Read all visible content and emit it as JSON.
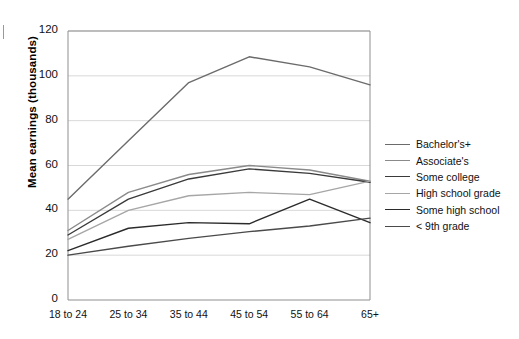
{
  "chart_data": {
    "type": "line",
    "title": "",
    "xlabel": "",
    "ylabel": "Mean earnings (thousands)",
    "categories": [
      "18 to 24",
      "25 to 34",
      "35 to 44",
      "45 to 54",
      "55 to 64",
      "65+"
    ],
    "ylim": [
      0,
      120
    ],
    "yticks": [
      0,
      20,
      40,
      60,
      80,
      100,
      120
    ],
    "grid": "horizontal",
    "legend_position": "right",
    "series": [
      {
        "name": "Bachelor's+",
        "values": [
          45,
          71,
          97,
          108.5,
          104,
          96
        ],
        "color": "#6b6b6b"
      },
      {
        "name": "Associate's",
        "values": [
          31,
          48,
          56,
          60,
          58,
          53
        ],
        "color": "#8a8a8a"
      },
      {
        "name": "Some college",
        "values": [
          29,
          45,
          54,
          58.5,
          56.5,
          52.5
        ],
        "color": "#3a3a3a"
      },
      {
        "name": "High school grade",
        "values": [
          27,
          40,
          46.5,
          48,
          47,
          53
        ],
        "color": "#a6a6a6"
      },
      {
        "name": "Some high school",
        "values": [
          22,
          32,
          34.5,
          34,
          45,
          34.5
        ],
        "color": "#2b2b2b"
      },
      {
        "name": "< 9th grade",
        "values": [
          20,
          24,
          27.5,
          30.5,
          33,
          36.5
        ],
        "color": "#4a4a4a"
      }
    ]
  },
  "axis": {
    "y_tick_labels": [
      "120",
      "100",
      "80",
      "60",
      "40",
      "20",
      "0"
    ],
    "y_axis_title": "Mean earnings (thousands)",
    "x_tick_labels": [
      "18 to 24",
      "25 to 34",
      "35 to 44",
      "45 to 54",
      "55 to 64",
      "65+"
    ]
  },
  "legend": {
    "items": [
      {
        "label": "Bachelor's+"
      },
      {
        "label": "Associate's"
      },
      {
        "label": "Some college"
      },
      {
        "label": "High school grade"
      },
      {
        "label": "Some high school"
      },
      {
        "label": "< 9th grade"
      }
    ]
  }
}
